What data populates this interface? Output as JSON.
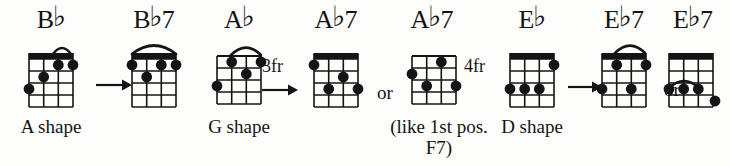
{
  "page": {
    "ink_color": "#141414",
    "paper_color": "#fdfdfc"
  },
  "labels": {
    "or": "or",
    "arrow": "arrow-right"
  },
  "groups": [
    {
      "id": "bb-group",
      "shape_label": "A shape",
      "chords": [
        {
          "id": "bb",
          "name_root": "B",
          "name_accidental": "♭",
          "name_suffix": "",
          "fret_label": "",
          "strings": 4,
          "frets": 4,
          "nut": "thick-barre-fret1",
          "arc": "fret1-strings-3-4",
          "dots": [
            {
              "string": 1,
              "fret": 3
            },
            {
              "string": 2,
              "fret": 2
            },
            {
              "string": 3,
              "fret": 1
            },
            {
              "string": 4,
              "fret": 1
            }
          ]
        },
        {
          "id": "bb7",
          "name_root": "B",
          "name_accidental": "♭",
          "name_suffix": "7",
          "fret_label": "",
          "strings": 4,
          "frets": 4,
          "nut": "thick-barre-fret1",
          "arc": "fret1-strings-1-4",
          "dots": [
            {
              "string": 1,
              "fret": 1
            },
            {
              "string": 2,
              "fret": 2
            },
            {
              "string": 3,
              "fret": 1
            },
            {
              "string": 4,
              "fret": 1
            }
          ]
        }
      ]
    },
    {
      "id": "ab-group",
      "shape_label": "G shape",
      "note_label": "(like 1st pos.\nF7)",
      "note_line1": "(like 1st pos.",
      "note_line2": "F7)",
      "chords": [
        {
          "id": "ab",
          "name_root": "A",
          "name_accidental": "♭",
          "name_suffix": "",
          "fret_label": "3fr",
          "strings": 4,
          "frets": 4,
          "nut": "none",
          "arc": "fret1-strings-2-4",
          "dots": [
            {
              "string": 1,
              "fret": 3
            },
            {
              "string": 2,
              "fret": 1
            },
            {
              "string": 3,
              "fret": 2
            },
            {
              "string": 4,
              "fret": 1
            }
          ]
        },
        {
          "id": "ab7-a",
          "name_root": "A",
          "name_accidental": "♭",
          "name_suffix": "7",
          "fret_label": "",
          "strings": 4,
          "frets": 4,
          "nut": "thick-barre-fret1",
          "arc": "none",
          "dots": [
            {
              "string": 1,
              "fret": 1
            },
            {
              "string": 2,
              "fret": 3
            },
            {
              "string": 3,
              "fret": 2
            },
            {
              "string": 4,
              "fret": 3
            }
          ]
        },
        {
          "id": "ab7-b",
          "name_root": "A",
          "name_accidental": "♭",
          "name_suffix": "7",
          "fret_label": "4fr",
          "strings": 4,
          "frets": 4,
          "nut": "none",
          "arc": "none",
          "dots": [
            {
              "string": 1,
              "fret": 2
            },
            {
              "string": 2,
              "fret": 3
            },
            {
              "string": 3,
              "fret": 1
            },
            {
              "string": 4,
              "fret": 3
            }
          ]
        }
      ]
    },
    {
      "id": "eb-group",
      "shape_label": "D shape",
      "chords": [
        {
          "id": "eb",
          "name_root": "E",
          "name_accidental": "♭",
          "name_suffix": "",
          "fret_label": "",
          "strings": 4,
          "frets": 4,
          "nut": "thick-barre-fret1",
          "arc": "none",
          "dots": [
            {
              "string": 1,
              "fret": 3
            },
            {
              "string": 2,
              "fret": 3
            },
            {
              "string": 3,
              "fret": 3
            },
            {
              "string": 4,
              "fret": 1
            }
          ]
        },
        {
          "id": "eb7-a",
          "name_root": "E",
          "name_accidental": "♭",
          "name_suffix": "7",
          "fret_label": "",
          "strings": 4,
          "frets": 4,
          "nut": "thick-barre-fret1",
          "arc": "fret1-strings-2-4",
          "dots": [
            {
              "string": 1,
              "fret": 3
            },
            {
              "string": 2,
              "fret": 1
            },
            {
              "string": 3,
              "fret": 3
            },
            {
              "string": 4,
              "fret": 1
            }
          ]
        },
        {
          "id": "eb7-b",
          "name_root": "E",
          "name_accidental": "♭",
          "name_suffix": "7",
          "fret_label": "",
          "strings": 4,
          "frets": 4,
          "nut": "thick-barre-fret1",
          "arc": "fret3-strings-1-3",
          "dots": [
            {
              "string": 1,
              "fret": 3
            },
            {
              "string": 2,
              "fret": 3
            },
            {
              "string": 3,
              "fret": 3
            },
            {
              "string": 4,
              "fret": 4
            }
          ]
        }
      ]
    }
  ]
}
